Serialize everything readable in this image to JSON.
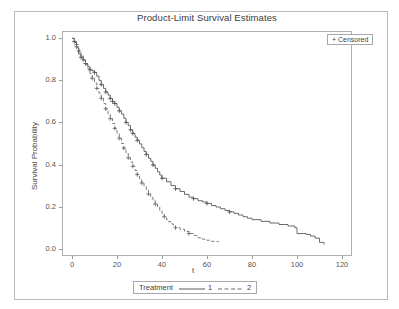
{
  "chart_data": {
    "type": "line",
    "title": "Product-Limit Survival Estimates",
    "xlabel": "t",
    "ylabel": "Survival Probability",
    "xlim": [
      -4,
      124
    ],
    "ylim": [
      -0.03,
      1.03
    ],
    "xticks": [
      0,
      20,
      40,
      60,
      80,
      100,
      120
    ],
    "yticks": [
      0.0,
      0.2,
      0.4,
      0.6,
      0.8,
      1.0
    ],
    "ytick_labels": [
      "0.0",
      "0.2",
      "0.4",
      "0.6",
      "0.8",
      "1.0"
    ],
    "xtick_labels": [
      "0",
      "20",
      "40",
      "60",
      "80",
      "100",
      "120"
    ],
    "grid": false,
    "legend_position": "bottom",
    "legend_title": "Treatment",
    "censor_legend": "+ Censored",
    "censor_marker": "+",
    "series": [
      {
        "name": "1",
        "label": "1",
        "linestyle": "solid",
        "color": "#5a5a5a",
        "steps": [
          [
            0,
            1.0
          ],
          [
            1,
            0.985
          ],
          [
            2,
            0.97
          ],
          [
            2,
            0.955
          ],
          [
            3,
            0.94
          ],
          [
            3,
            0.925
          ],
          [
            4,
            0.91
          ],
          [
            5,
            0.895
          ],
          [
            6,
            0.88
          ],
          [
            7,
            0.865
          ],
          [
            8,
            0.85
          ],
          [
            9,
            0.845
          ],
          [
            10,
            0.838
          ],
          [
            11,
            0.82
          ],
          [
            12,
            0.8
          ],
          [
            13,
            0.78
          ],
          [
            14,
            0.762
          ],
          [
            15,
            0.745
          ],
          [
            16,
            0.73
          ],
          [
            17,
            0.714
          ],
          [
            18,
            0.7
          ],
          [
            19,
            0.69
          ],
          [
            20,
            0.672
          ],
          [
            21,
            0.655
          ],
          [
            22,
            0.64
          ],
          [
            23,
            0.62
          ],
          [
            24,
            0.6
          ],
          [
            25,
            0.585
          ],
          [
            26,
            0.565
          ],
          [
            27,
            0.548
          ],
          [
            28,
            0.53
          ],
          [
            29,
            0.515
          ],
          [
            30,
            0.498
          ],
          [
            31,
            0.48
          ],
          [
            32,
            0.462
          ],
          [
            33,
            0.448
          ],
          [
            34,
            0.43
          ],
          [
            35,
            0.415
          ],
          [
            36,
            0.398
          ],
          [
            37,
            0.382
          ],
          [
            38,
            0.365
          ],
          [
            39,
            0.35
          ],
          [
            40,
            0.335
          ],
          [
            42,
            0.318
          ],
          [
            44,
            0.3
          ],
          [
            46,
            0.285
          ],
          [
            48,
            0.272
          ],
          [
            50,
            0.258
          ],
          [
            52,
            0.245
          ],
          [
            54,
            0.238
          ],
          [
            56,
            0.228
          ],
          [
            58,
            0.222
          ],
          [
            60,
            0.215
          ],
          [
            62,
            0.205
          ],
          [
            64,
            0.198
          ],
          [
            66,
            0.19
          ],
          [
            68,
            0.182
          ],
          [
            70,
            0.175
          ],
          [
            72,
            0.168
          ],
          [
            74,
            0.16
          ],
          [
            76,
            0.152
          ],
          [
            78,
            0.145
          ],
          [
            80,
            0.138
          ],
          [
            84,
            0.13
          ],
          [
            88,
            0.122
          ],
          [
            92,
            0.115
          ],
          [
            96,
            0.108
          ],
          [
            99,
            0.1
          ],
          [
            100,
            0.072
          ],
          [
            104,
            0.068
          ],
          [
            106,
            0.06
          ],
          [
            108,
            0.05
          ],
          [
            110,
            0.03
          ],
          [
            112,
            0.02
          ]
        ],
        "censor_points": [
          [
            1,
            0.985
          ],
          [
            2,
            0.97
          ],
          [
            3,
            0.94
          ],
          [
            4,
            0.91
          ],
          [
            6,
            0.88
          ],
          [
            8,
            0.85
          ],
          [
            10,
            0.838
          ],
          [
            13,
            0.78
          ],
          [
            15,
            0.745
          ],
          [
            17,
            0.714
          ],
          [
            18,
            0.7
          ],
          [
            19,
            0.69
          ],
          [
            21,
            0.655
          ],
          [
            24,
            0.6
          ],
          [
            26,
            0.565
          ],
          [
            27,
            0.548
          ],
          [
            29,
            0.515
          ],
          [
            33,
            0.448
          ],
          [
            36,
            0.398
          ],
          [
            40,
            0.335
          ],
          [
            46,
            0.285
          ],
          [
            54,
            0.238
          ],
          [
            60,
            0.215
          ],
          [
            70,
            0.175
          ]
        ]
      },
      {
        "name": "2",
        "label": "2",
        "linestyle": "dashed",
        "color": "#6d6d6d",
        "steps": [
          [
            0,
            1.0
          ],
          [
            1,
            0.98
          ],
          [
            2,
            0.96
          ],
          [
            3,
            0.94
          ],
          [
            4,
            0.918
          ],
          [
            5,
            0.898
          ],
          [
            6,
            0.875
          ],
          [
            7,
            0.855
          ],
          [
            8,
            0.832
          ],
          [
            9,
            0.81
          ],
          [
            10,
            0.788
          ],
          [
            11,
            0.762
          ],
          [
            12,
            0.74
          ],
          [
            13,
            0.715
          ],
          [
            14,
            0.69
          ],
          [
            15,
            0.665
          ],
          [
            16,
            0.64
          ],
          [
            17,
            0.618
          ],
          [
            18,
            0.595
          ],
          [
            19,
            0.572
          ],
          [
            20,
            0.548
          ],
          [
            21,
            0.525
          ],
          [
            22,
            0.5
          ],
          [
            23,
            0.478
          ],
          [
            24,
            0.455
          ],
          [
            25,
            0.432
          ],
          [
            26,
            0.412
          ],
          [
            27,
            0.392
          ],
          [
            28,
            0.372
          ],
          [
            29,
            0.352
          ],
          [
            30,
            0.332
          ],
          [
            31,
            0.312
          ],
          [
            32,
            0.295
          ],
          [
            33,
            0.278
          ],
          [
            34,
            0.26
          ],
          [
            35,
            0.242
          ],
          [
            36,
            0.228
          ],
          [
            37,
            0.212
          ],
          [
            38,
            0.198
          ],
          [
            39,
            0.182
          ],
          [
            40,
            0.168
          ],
          [
            41,
            0.152
          ],
          [
            42,
            0.138
          ],
          [
            43,
            0.128
          ],
          [
            44,
            0.118
          ],
          [
            45,
            0.108
          ],
          [
            46,
            0.1
          ],
          [
            48,
            0.092
          ],
          [
            50,
            0.082
          ],
          [
            52,
            0.072
          ],
          [
            54,
            0.062
          ],
          [
            56,
            0.052
          ],
          [
            58,
            0.045
          ],
          [
            60,
            0.04
          ],
          [
            62,
            0.035
          ],
          [
            65,
            0.03
          ]
        ],
        "censor_points": [
          [
            2,
            0.96
          ],
          [
            5,
            0.898
          ],
          [
            9,
            0.81
          ],
          [
            11,
            0.762
          ],
          [
            13,
            0.715
          ],
          [
            15,
            0.665
          ],
          [
            17,
            0.618
          ],
          [
            19,
            0.572
          ],
          [
            21,
            0.525
          ],
          [
            23,
            0.478
          ],
          [
            25,
            0.432
          ],
          [
            27,
            0.392
          ],
          [
            29,
            0.352
          ],
          [
            31,
            0.312
          ],
          [
            34,
            0.26
          ],
          [
            37,
            0.212
          ],
          [
            41,
            0.152
          ],
          [
            46,
            0.1
          ],
          [
            52,
            0.072
          ]
        ]
      }
    ]
  }
}
